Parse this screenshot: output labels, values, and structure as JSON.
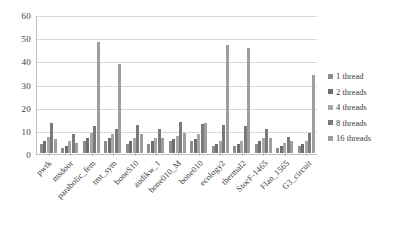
{
  "chart_data": {
    "type": "bar",
    "title": "",
    "subtitle": "",
    "xlabel": "",
    "ylabel": "",
    "ylim": [
      0,
      60
    ],
    "yticks": [
      0,
      10,
      20,
      30,
      40,
      50,
      60
    ],
    "ytick_labels": [
      "0",
      "10",
      "20",
      "30",
      "40",
      "50",
      "60"
    ],
    "grid": true,
    "grid_axis": "y",
    "legend_position": "right",
    "categories": [
      "pwtk",
      "msdoor",
      "parabolic_fem",
      "tmt_sym",
      "boneS10",
      "audikw_1",
      "bone010_M",
      "bone010",
      "ecology2",
      "thermal2",
      "StocF-1465",
      "Flan_1565",
      "G3_circuit"
    ],
    "series": [
      {
        "name": "1 thread",
        "color": "#8c8c8c",
        "values": [
          4.0,
          2.3,
          5.2,
          5.0,
          4.1,
          4.0,
          5.3,
          5.0,
          3.0,
          3.2,
          4.1,
          2.3,
          3.0
        ]
      },
      {
        "name": "2 threads",
        "color": "#6e6e6e",
        "values": [
          5.3,
          3.2,
          6.5,
          6.5,
          5.2,
          5.0,
          6.2,
          6.2,
          4.0,
          4.1,
          5.2,
          3.1,
          4.0
        ]
      },
      {
        "name": "4 threads",
        "color": "#a6a6a6",
        "values": [
          7.0,
          5.2,
          8.8,
          8.0,
          6.5,
          6.5,
          7.3,
          8.0,
          5.3,
          5.2,
          6.5,
          4.2,
          5.2
        ]
      },
      {
        "name": "8 threads",
        "color": "#7a7a7a",
        "values": [
          13.0,
          8.0,
          11.5,
          10.5,
          12.0,
          10.5,
          13.5,
          12.5,
          12.0,
          11.5,
          10.5,
          7.0,
          8.5
        ]
      },
      {
        "name": "16 threads",
        "color": "#9e9e9e",
        "values": [
          6.0,
          4.2,
          48.0,
          38.5,
          8.0,
          6.5,
          8.5,
          13.0,
          46.5,
          45.5,
          6.5,
          5.0,
          33.5
        ]
      }
    ]
  },
  "legend": {
    "items": [
      {
        "label": "1 thread"
      },
      {
        "label": "2 threads"
      },
      {
        "label": "4 threads"
      },
      {
        "label": "8 threads"
      },
      {
        "label": "16 threads"
      }
    ]
  }
}
